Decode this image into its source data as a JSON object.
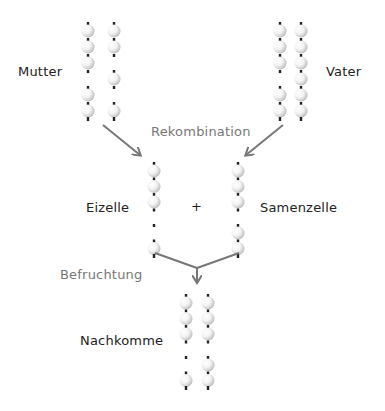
{
  "labels": {
    "mother": "Mutter",
    "father": "Vater",
    "recombination": "Rekombination",
    "egg_cell": "Eizelle",
    "plus": "+",
    "sperm_cell": "Samenzelle",
    "fertilization": "Befruchtung",
    "offspring": "Nachkomme"
  },
  "colors": {
    "text": "#222222",
    "process_text": "#777777",
    "arrow": "#777777",
    "bead_shade": "#b8b8b8",
    "centromere_dot": "#222222"
  },
  "chromosome_sets": {
    "mother": {
      "chromosomes": [
        {
          "beads": [
            1,
            1,
            1,
            0,
            1,
            1
          ]
        },
        {
          "beads": [
            1,
            1,
            0,
            1,
            0,
            1
          ]
        }
      ]
    },
    "father": {
      "chromosomes": [
        {
          "beads": [
            1,
            1,
            1,
            0,
            1,
            1
          ]
        },
        {
          "beads": [
            1,
            1,
            1,
            1,
            1,
            1
          ]
        }
      ]
    },
    "egg_cell": {
      "chromosomes": [
        {
          "beads": [
            1,
            1,
            1,
            0,
            0,
            1
          ]
        }
      ]
    },
    "sperm_cell": {
      "chromosomes": [
        {
          "beads": [
            1,
            1,
            1,
            0,
            1,
            1
          ]
        }
      ]
    },
    "offspring": {
      "chromosomes": [
        {
          "beads": [
            1,
            1,
            1,
            0,
            0,
            1
          ]
        },
        {
          "beads": [
            1,
            1,
            1,
            0,
            1,
            1
          ]
        }
      ]
    }
  }
}
